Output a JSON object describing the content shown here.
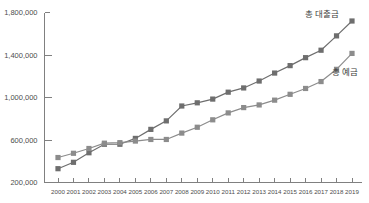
{
  "chart_data": {
    "type": "line",
    "title": "",
    "subtitle": "",
    "xlabel": "",
    "ylabel": "",
    "grid": false,
    "legend_position": "inline-right",
    "categories": [
      "2000",
      "2001",
      "2002",
      "2003",
      "2004",
      "2005",
      "2006",
      "2007",
      "2008",
      "2009",
      "2010",
      "2011",
      "2012",
      "2013",
      "2014",
      "2015",
      "2016",
      "2017",
      "2018",
      "2019"
    ],
    "ylim": [
      200000,
      1800000
    ],
    "yticks": [
      200000,
      600000,
      1000000,
      1400000,
      1800000
    ],
    "ytick_labels": [
      "200,000",
      "600,000",
      "1,000,000",
      "1,400,000",
      "1,800,000"
    ],
    "series": [
      {
        "name": "총 대출금",
        "label": "총 대출금",
        "color": "#6e6e6e",
        "marker": "square",
        "values": [
          330000,
          390000,
          480000,
          560000,
          560000,
          615000,
          700000,
          780000,
          920000,
          950000,
          985000,
          1050000,
          1090000,
          1155000,
          1230000,
          1300000,
          1375000,
          1445000,
          1580000,
          1720000
        ]
      },
      {
        "name": "총 예금",
        "label": "총 예금",
        "color": "#8c8c8c",
        "marker": "square",
        "values": [
          435000,
          475000,
          520000,
          570000,
          575000,
          590000,
          605000,
          605000,
          665000,
          720000,
          790000,
          855000,
          905000,
          930000,
          975000,
          1030000,
          1085000,
          1150000,
          1265000,
          1415000
        ]
      }
    ]
  },
  "annotations": {
    "loans_label": "총 대출금",
    "deposits_label": "총 예금"
  },
  "axis": {
    "y_axis_name": "y-axis",
    "x_axis_name": "x-axis"
  }
}
